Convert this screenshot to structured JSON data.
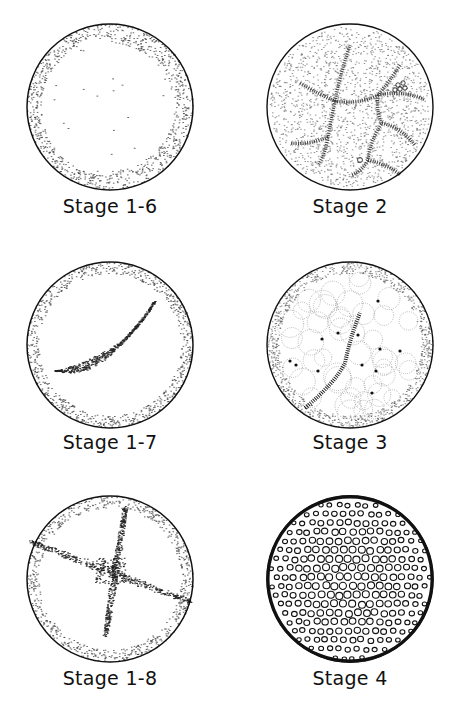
{
  "figure": {
    "panels": [
      {
        "id": "stage-1-6",
        "label": "Stage 1-6",
        "pattern": "sparse-dots-rim"
      },
      {
        "id": "stage-2",
        "label": "Stage 2",
        "pattern": "large-irregular-cells-dark-furrows"
      },
      {
        "id": "stage-1-7",
        "label": "Stage 1-7",
        "pattern": "curved-dot-streak"
      },
      {
        "id": "stage-3",
        "label": "Stage 3",
        "pattern": "polygonal-cells-with-nuclei"
      },
      {
        "id": "stage-1-8",
        "label": "Stage 1-8",
        "pattern": "cross-shaped-dot-streaks"
      },
      {
        "id": "stage-4",
        "label": "Stage 4",
        "pattern": "dense-small-cells"
      }
    ]
  }
}
